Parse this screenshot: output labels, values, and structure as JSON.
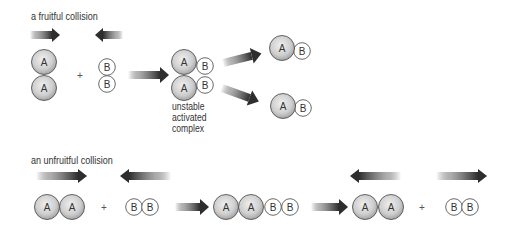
{
  "diagram": {
    "colors": {
      "atom_a_fill_light": "#eeeeee",
      "atom_a_fill_dark": "#9a9a9a",
      "atom_b_fill": "#ffffff",
      "outline": "#444444",
      "arrow_dark": "#2e2e2e",
      "text": "#333333"
    },
    "fruitful": {
      "label": "a fruitful collision",
      "reactant_a": {
        "atoms": [
          "A",
          "A"
        ],
        "orientation": "vertical"
      },
      "plus": "+",
      "reactant_b": {
        "atoms": [
          "B",
          "B"
        ],
        "orientation": "vertical"
      },
      "complex": {
        "atoms": [
          "A",
          "B",
          "A",
          "B"
        ],
        "label_lines": [
          "unstable",
          "activated",
          "complex"
        ]
      },
      "products": [
        {
          "atoms": [
            "A",
            "B"
          ]
        },
        {
          "atoms": [
            "A",
            "B"
          ]
        }
      ]
    },
    "unfruitful": {
      "label": "an unfruitful collision",
      "reactant_a": {
        "atoms": [
          "A",
          "A"
        ]
      },
      "plus_1": "+",
      "reactant_b": {
        "atoms": [
          "B",
          "B"
        ]
      },
      "intermediate": {
        "atoms": [
          "A",
          "A",
          "B",
          "B"
        ]
      },
      "result_a": {
        "atoms": [
          "A",
          "A"
        ]
      },
      "plus_2": "+",
      "result_b": {
        "atoms": [
          "B",
          "B"
        ]
      }
    }
  }
}
